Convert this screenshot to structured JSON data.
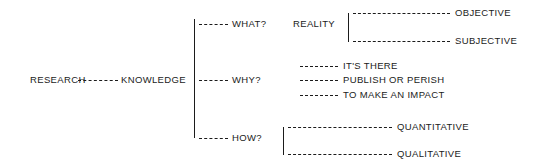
{
  "diagram": {
    "background_color": "#ffffff",
    "ink_color": "#1b1b1b",
    "root": "RESEARCH",
    "nodes": {
      "research": "RESEARCH",
      "knowledge": "KNOWLEDGE",
      "what": "WHAT?",
      "why": "WHY?",
      "how": "HOW?",
      "reality": "REALITY",
      "objective": "OBJECTIVE",
      "subjective": "SUBJECTIVE",
      "its_there": "IT'S THERE",
      "publish_or_perish": "PUBLISH OR PERISH",
      "to_make_an_impact": "TO MAKE AN IMPACT",
      "quantitative": "QUANTITATIVE",
      "qualitative": "QUALITATIVE"
    },
    "branches": [
      {
        "question": "WHAT?",
        "subject": "REALITY",
        "answers": [
          "OBJECTIVE",
          "SUBJECTIVE"
        ]
      },
      {
        "question": "WHY?",
        "subject": "",
        "answers": [
          "IT'S THERE",
          "PUBLISH OR PERISH",
          "TO MAKE AN IMPACT"
        ]
      },
      {
        "question": "HOW?",
        "subject": "",
        "answers": [
          "QUANTITATIVE",
          "QUALITATIVE"
        ]
      }
    ]
  }
}
